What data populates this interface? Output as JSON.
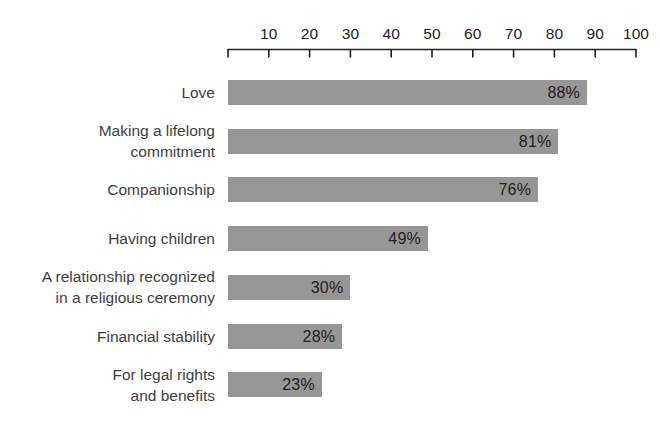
{
  "chart_data": {
    "type": "bar",
    "orientation": "horizontal",
    "title": "",
    "xlabel": "",
    "ylabel": "",
    "xlim": [
      0,
      100
    ],
    "grid": false,
    "legend": false,
    "value_suffix": "%",
    "axis": {
      "position": "top",
      "ticks": [
        10,
        20,
        30,
        40,
        50,
        60,
        70,
        80,
        90,
        100
      ],
      "tick_labels": [
        "10",
        "20",
        "30",
        "40",
        "50",
        "60",
        "70",
        "80",
        "90",
        "100"
      ],
      "min": 0,
      "max": 100
    },
    "categories": [
      "Love",
      "Making a lifelong\ncommitment",
      "Companionship",
      "Having children",
      "A relationship recognized\nin a religious ceremony",
      "Financial stability",
      "For legal rights\nand benefits"
    ],
    "values": [
      88,
      81,
      76,
      49,
      30,
      28,
      23
    ],
    "value_labels": [
      "88%",
      "81%",
      "76%",
      "49%",
      "30%",
      "28%",
      "23%"
    ]
  },
  "style": {
    "bar_color": "#969696",
    "background_color": "#ffffff",
    "axis_color": "#231f20",
    "label_color": "#3e3e42",
    "value_color": "#231f20"
  }
}
